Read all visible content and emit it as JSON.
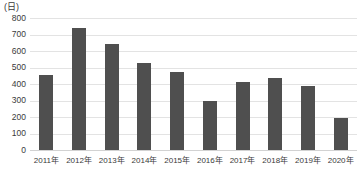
{
  "chart_data": {
    "type": "bar",
    "title": "",
    "subtitle": "",
    "xlabel": "",
    "ylabel": "(日)",
    "unit_label": "(日)",
    "categories": [
      "2011年",
      "2012年",
      "2013年",
      "2014年",
      "2015年",
      "2016年",
      "2017年",
      "2018年",
      "2019年",
      "2020年"
    ],
    "values": [
      455,
      740,
      640,
      530,
      470,
      295,
      415,
      435,
      385,
      195
    ],
    "series": [
      {
        "name": "",
        "values": [
          455,
          740,
          640,
          530,
          470,
          295,
          415,
          435,
          385,
          195
        ]
      }
    ],
    "ylim": [
      0,
      800
    ],
    "ytick_step": 100,
    "ytick_labels": [
      "800",
      "700",
      "600",
      "500",
      "400",
      "300",
      "200",
      "100",
      "0"
    ],
    "ytick_values": [
      800,
      700,
      600,
      500,
      400,
      300,
      200,
      100,
      0
    ],
    "grid": true,
    "grid_axis": "y",
    "legend": false,
    "legend_position": "none",
    "bar_color": "#4f4f4f",
    "gridline_color": "#e3e3e3",
    "background_color": "#ffffff",
    "text_color": "#3a3a3a"
  }
}
